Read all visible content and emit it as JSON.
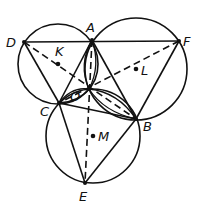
{
  "diagram": {
    "colors": {
      "ink": "#111111",
      "background": "#ffffff"
    },
    "points": {
      "A": {
        "label": "A",
        "x": 92,
        "y": 40,
        "lx": 86,
        "ly": 32
      },
      "D": {
        "label": "D",
        "x": 24,
        "y": 42,
        "lx": 6,
        "ly": 47
      },
      "F": {
        "label": "F",
        "x": 179,
        "y": 41,
        "lx": 183,
        "ly": 46
      },
      "C": {
        "label": "C",
        "x": 59,
        "y": 103,
        "lx": 40,
        "ly": 116
      },
      "B": {
        "label": "B",
        "x": 136,
        "y": 119,
        "lx": 143,
        "ly": 131
      },
      "E": {
        "label": "E",
        "x": 85,
        "y": 183,
        "lx": 79,
        "ly": 201
      },
      "O": {
        "label": "O",
        "x": 89,
        "y": 89,
        "lx": 70,
        "ly": 101
      },
      "K": {
        "label": "K",
        "x": 58,
        "y": 64,
        "lx": 55,
        "ly": 56
      },
      "L": {
        "label": "L",
        "x": 136,
        "y": 69,
        "lx": 141,
        "ly": 75
      },
      "M": {
        "label": "M",
        "x": 93,
        "y": 136,
        "lx": 98,
        "ly": 141
      }
    },
    "circles": [
      {
        "name": "circle-K",
        "center": "K",
        "r": 40
      },
      {
        "name": "circle-L",
        "center": "L",
        "r": 51
      },
      {
        "name": "circle-M",
        "center": "M",
        "r": 47
      }
    ],
    "solid_segments": [
      [
        "D",
        "F"
      ],
      [
        "D",
        "C"
      ],
      [
        "A",
        "C"
      ],
      [
        "A",
        "B"
      ],
      [
        "F",
        "B"
      ],
      [
        "C",
        "E"
      ],
      [
        "B",
        "E"
      ],
      [
        "C",
        "B"
      ]
    ],
    "dashed_segments": [
      [
        "D",
        "B"
      ],
      [
        "F",
        "C"
      ],
      [
        "A",
        "E"
      ]
    ]
  }
}
